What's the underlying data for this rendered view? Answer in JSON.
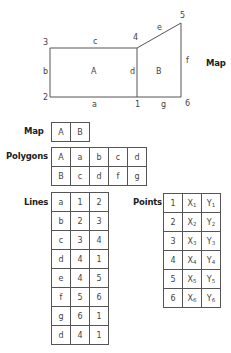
{
  "map_diagram": {
    "point_labels": [
      "1",
      "2",
      "3",
      "4",
      "5",
      "6"
    ],
    "line_labels": {
      "a": "a",
      "b": "b",
      "c": "c",
      "d": "d",
      "e": "e",
      "f": "f",
      "g": "g"
    },
    "polygon_labels": {
      "A": "A",
      "B": "B"
    },
    "title": "Map"
  },
  "tables": {
    "map": {
      "title": "Map",
      "cells": [
        "A",
        "B"
      ]
    },
    "polygons": {
      "title": "Polygons",
      "rows": [
        [
          "A",
          "a",
          "b",
          "c",
          "d"
        ],
        [
          "B",
          "c",
          "d",
          "f",
          "g"
        ]
      ]
    },
    "lines": {
      "title": "Lines",
      "rows": [
        [
          "a",
          "1",
          "2"
        ],
        [
          "b",
          "2",
          "3"
        ],
        [
          "c",
          "3",
          "4"
        ],
        [
          "d",
          "4",
          "1"
        ],
        [
          "e",
          "4",
          "5"
        ],
        [
          "f",
          "5",
          "6"
        ],
        [
          "g",
          "6",
          "1"
        ],
        [
          "d",
          "4",
          "1"
        ]
      ]
    },
    "points": {
      "title": "Points",
      "rows": [
        {
          "id": "1",
          "x": "X",
          "xs": "1",
          "y": "Y",
          "ys": "1"
        },
        {
          "id": "2",
          "x": "X",
          "xs": "2",
          "y": "Y",
          "ys": "2"
        },
        {
          "id": "3",
          "x": "X",
          "xs": "3",
          "y": "Y",
          "ys": "3"
        },
        {
          "id": "4",
          "x": "X",
          "xs": "4",
          "y": "Y",
          "ys": "4"
        },
        {
          "id": "5",
          "x": "X",
          "xs": "5",
          "y": "Y",
          "ys": "5"
        },
        {
          "id": "6",
          "x": "X",
          "xs": "6",
          "y": "Y",
          "ys": "6"
        }
      ]
    }
  }
}
